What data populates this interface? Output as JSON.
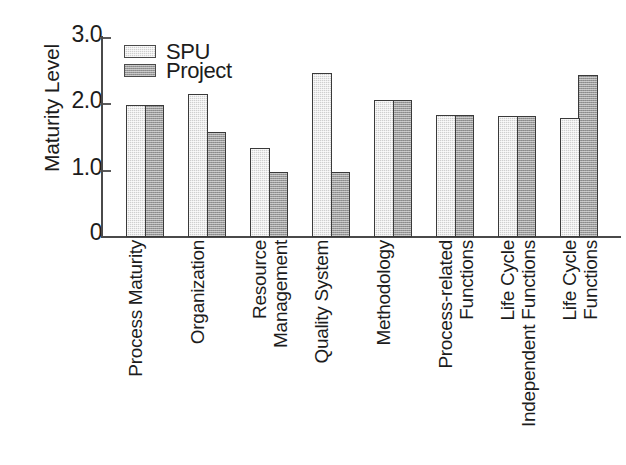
{
  "chart_data": {
    "type": "bar",
    "title": "",
    "xlabel": "",
    "ylabel": "Maturity Level",
    "ylim": [
      0,
      3.0
    ],
    "ytick_labels": [
      "0",
      "1.0",
      "2.0",
      "3.0"
    ],
    "ytick_values": [
      0,
      1.0,
      2.0,
      3.0
    ],
    "grid": false,
    "legend_position": "top-left",
    "categories": [
      "Process Maturity",
      "Organization",
      "Resource Management",
      "Quality System",
      "Methodology",
      "Process-related Functions",
      "Life Cycle Independent Functions",
      "Life Cycle Functions"
    ],
    "category_label_lines": [
      [
        "Process Maturity"
      ],
      [
        "Organization"
      ],
      [
        "Resource",
        "Management"
      ],
      [
        "Quality System"
      ],
      [
        "Methodology"
      ],
      [
        "Process-related",
        "Functions"
      ],
      [
        "Life Cycle",
        "Independent Functions"
      ],
      [
        "Life Cycle",
        "Functions"
      ]
    ],
    "series": [
      {
        "name": "SPU",
        "color": "#cfcfcf",
        "values": [
          1.98,
          2.14,
          1.33,
          2.46,
          2.05,
          1.83,
          1.82,
          1.79
        ]
      },
      {
        "name": "Project",
        "color": "#9a9a9a",
        "values": [
          1.98,
          1.57,
          0.97,
          0.97,
          2.06,
          1.83,
          1.82,
          2.43
        ]
      }
    ]
  },
  "legend": {
    "entries": [
      {
        "label": "SPU",
        "swatch": "spu-swatch"
      },
      {
        "label": "Project",
        "swatch": "project-swatch"
      }
    ]
  },
  "axes": {
    "y_title": "Maturity Level",
    "y_ticks": [
      "3.0",
      "2.0",
      "1.0",
      "0"
    ]
  }
}
